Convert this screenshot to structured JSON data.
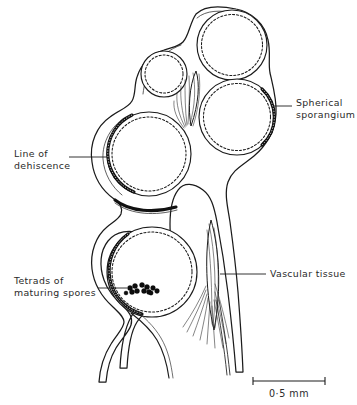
{
  "figure": {
    "background_color": "#ffffff",
    "ink_color": "#1b1b1b",
    "text_color": "#2a2a2a"
  },
  "labels": {
    "spherical_sporangium": {
      "line1": "Spherical",
      "line2": "sporangium"
    },
    "line_of_dehiscence": {
      "line1": "Line of",
      "line2": "dehiscence"
    },
    "tetrads_of_maturing_spores": {
      "line1": "Tetrads of",
      "line2": "maturing spores"
    },
    "vascular_tissue": {
      "line1": "Vascular tissue"
    }
  },
  "scale_bar": {
    "label": "0·5 mm",
    "length_px": 72,
    "represents": "0.5 mm"
  },
  "structures": {
    "sporangia": [
      {
        "name": "upper-right-sporangium",
        "cx": 232,
        "cy": 45,
        "r": 35
      },
      {
        "name": "small-upper-left-sporangium",
        "cx": 164,
        "cy": 74,
        "r": 23
      },
      {
        "name": "right-middle-sporangium",
        "cx": 237,
        "cy": 117,
        "r": 38
      },
      {
        "name": "left-middle-sporangium",
        "cx": 149,
        "cy": 154,
        "r": 42
      },
      {
        "name": "lower-sporangium",
        "cx": 152,
        "cy": 272,
        "r": 45
      }
    ],
    "tetrad_clusters": 3,
    "vascular_bundles": 2
  }
}
